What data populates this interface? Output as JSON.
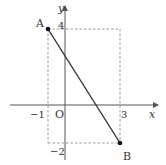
{
  "diagram": {
    "type": "coordinate-plane",
    "axes": {
      "x_label": "x",
      "y_label": "y",
      "origin_label": "O"
    },
    "ticks": {
      "x_neg": "−1",
      "x_pos": "3",
      "y_pos": "4",
      "y_neg": "−2"
    },
    "points": [
      {
        "label": "A",
        "x": -1,
        "y": 4
      },
      {
        "label": "B",
        "x": 3,
        "y": -2
      }
    ],
    "segment": {
      "from": "A",
      "to": "B"
    },
    "guide_rectangle": {
      "x_min": -1,
      "x_max": 3,
      "y_min": -2,
      "y_max": 4,
      "style": "dashed"
    },
    "colors": {
      "axis": "#555555",
      "segment": "#333333",
      "dashed": "#999999",
      "point": "#111111",
      "text": "#333333"
    }
  }
}
